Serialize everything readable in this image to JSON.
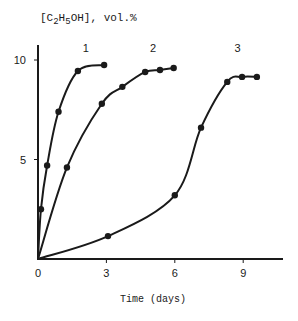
{
  "chart_data": {
    "type": "line",
    "title": "",
    "ylabel": "[C2H5OH], vol.%",
    "ylabel_parts": {
      "prefix": "[C",
      "sub1": "2",
      "mid": "H",
      "sub2": "5",
      "suffix": "OH], vol.%"
    },
    "xlabel": "Time (days)",
    "xlim": [
      0,
      10.7
    ],
    "ylim": [
      0,
      10.7
    ],
    "xticks": [
      0,
      3,
      6,
      9
    ],
    "yticks": [
      5,
      10
    ],
    "xtick_labels": [
      "0",
      "3",
      "6",
      "9"
    ],
    "ytick_labels": [
      "5",
      "10"
    ],
    "grid": false,
    "legend": "inline curve labels",
    "series": [
      {
        "name": "1",
        "points": [
          [
            0,
            0
          ],
          [
            0.13,
            2.5
          ],
          [
            0.4,
            4.7
          ],
          [
            0.9,
            7.4
          ],
          [
            1.75,
            9.45
          ],
          [
            2.9,
            9.75
          ]
        ],
        "markers": [
          [
            0.13,
            2.5
          ],
          [
            0.4,
            4.7
          ],
          [
            0.9,
            7.4
          ],
          [
            1.75,
            9.45
          ],
          [
            2.9,
            9.75
          ]
        ],
        "label_pos": [
          2.1,
          10.6
        ]
      },
      {
        "name": "2",
        "points": [
          [
            0,
            0
          ],
          [
            1.27,
            4.6
          ],
          [
            2.8,
            7.8
          ],
          [
            3.7,
            8.65
          ],
          [
            4.7,
            9.4
          ],
          [
            5.35,
            9.5
          ],
          [
            5.95,
            9.6
          ]
        ],
        "markers": [
          [
            1.27,
            4.6
          ],
          [
            2.8,
            7.8
          ],
          [
            3.7,
            8.65
          ],
          [
            4.7,
            9.4
          ],
          [
            5.35,
            9.5
          ],
          [
            5.95,
            9.6
          ]
        ],
        "label_pos": [
          5.05,
          10.6
        ]
      },
      {
        "name": "3",
        "points": [
          [
            0,
            0
          ],
          [
            3.07,
            1.15
          ],
          [
            6.0,
            3.2
          ],
          [
            7.15,
            6.6
          ],
          [
            8.3,
            8.9
          ],
          [
            8.95,
            9.15
          ],
          [
            9.6,
            9.15
          ]
        ],
        "markers": [
          [
            3.07,
            1.15
          ],
          [
            6.0,
            3.2
          ],
          [
            7.15,
            6.6
          ],
          [
            8.3,
            8.9
          ],
          [
            8.95,
            9.15
          ],
          [
            9.6,
            9.15
          ]
        ],
        "label_pos": [
          8.75,
          10.6
        ]
      }
    ]
  },
  "colors": {
    "ink": "#1a1a1a",
    "background": "#ffffff"
  }
}
